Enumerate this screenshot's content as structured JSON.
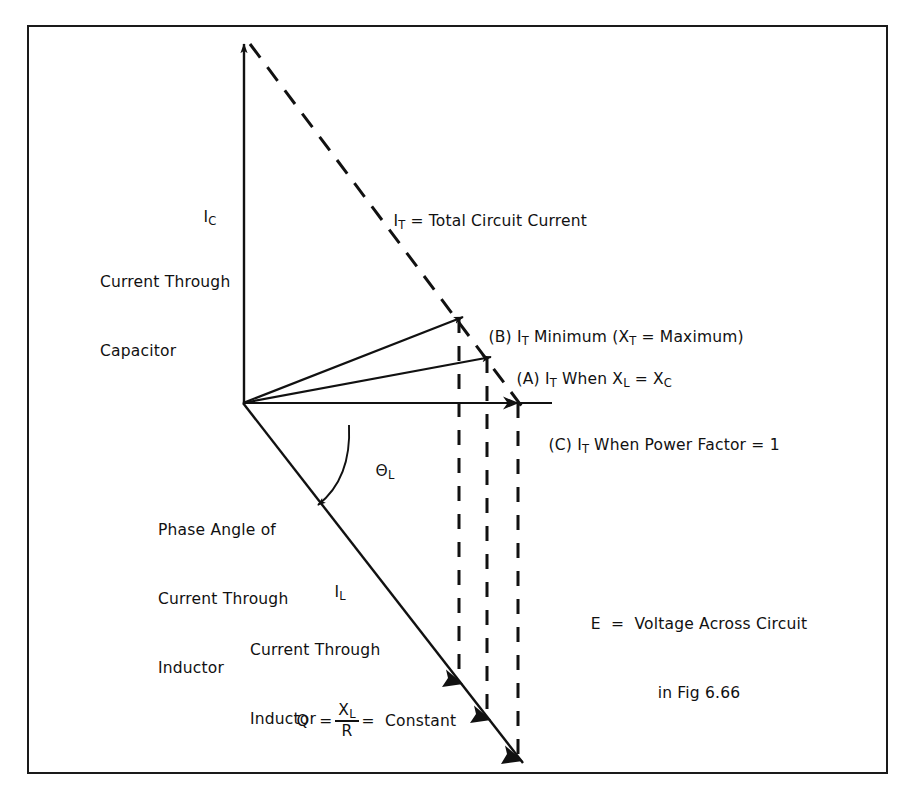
{
  "figure": {
    "kind": "phasor-diagram",
    "title_implicit": "Parallel LC circuit phasor diagram",
    "border_color": "#1a1a1a",
    "line_color": "#111111",
    "background": "#ffffff"
  },
  "axes": {
    "origin": {
      "x": 243,
      "y": 403
    },
    "vertical": {
      "name": "capacitive-current-axis",
      "tip": {
        "x": 244,
        "y": 37
      },
      "label_symbol": "I",
      "label_sub": "C",
      "caption_line1": "Current Through",
      "caption_line2": "Capacitor"
    },
    "horizontal": {
      "name": "resistive-axis",
      "end": {
        "x": 552,
        "y": 403
      }
    }
  },
  "vectors": [
    {
      "id": "IT-dashed",
      "name": "total-current-dashed-locus",
      "style": "dashed",
      "from": {
        "x": 249,
        "y": 42
      },
      "to": {
        "x": 522,
        "y": 406
      },
      "label": "I",
      "label_sub": "T",
      "label_text": " = Total Circuit Current"
    },
    {
      "id": "B",
      "name": "it-minimum-vector",
      "style": "solid-arrow",
      "from": {
        "x": 243,
        "y": 403
      },
      "to": {
        "x": 461,
        "y": 318
      },
      "marker": "(B)",
      "label_main": "I",
      "label_sub": "T",
      "label_rest": " Minimum (X",
      "label_sub2": "T",
      "label_rest2": " = Maximum)"
    },
    {
      "id": "A",
      "name": "it-resonance-vector",
      "style": "solid-arrow",
      "from": {
        "x": 243,
        "y": 403
      },
      "to": {
        "x": 489,
        "y": 358
      },
      "marker": "(A)",
      "label_main": "I",
      "label_sub": "T",
      "label_rest": " When X",
      "label_sub2": "L",
      "label_rest2": " = X",
      "label_sub3": "C"
    },
    {
      "id": "C",
      "name": "it-unity-power-factor-vector",
      "style": "solid-arrow",
      "from": {
        "x": 243,
        "y": 403
      },
      "to": {
        "x": 519,
        "y": 403
      },
      "marker": "(C)",
      "label_main": "I",
      "label_sub": "T",
      "label_rest": " When Power Factor = 1"
    },
    {
      "id": "IL",
      "name": "inductor-current-vector",
      "style": "solid-arrow-triple",
      "from": {
        "x": 243,
        "y": 403
      },
      "to": {
        "x": 522,
        "y": 762
      },
      "label_symbol": "I",
      "label_sub": "L",
      "caption_line1": "Current Through",
      "caption_line2": "Inductor",
      "arrowhead_points": [
        {
          "x": 461,
          "y": 682
        },
        {
          "x": 489,
          "y": 718
        },
        {
          "x": 520,
          "y": 758
        }
      ]
    }
  ],
  "projection_lines": [
    {
      "name": "projection-B",
      "x": 459,
      "y_top": 318,
      "y_bottom": 684
    },
    {
      "name": "projection-A",
      "x": 487,
      "y_top": 358,
      "y_bottom": 720
    },
    {
      "name": "projection-C",
      "x": 518,
      "y_top": 403,
      "y_bottom": 760
    }
  ],
  "angle": {
    "name": "phase-angle-arc",
    "symbol": "Θ",
    "sub": "L",
    "caption_line1": "Phase Angle of",
    "caption_line2": "Current Through",
    "caption_line3": "Inductor"
  },
  "notes": {
    "q_formula": {
      "name": "q-factor-formula",
      "lhs": "Q",
      "eq1": "=",
      "num": "X",
      "num_sub": "L",
      "den": "R",
      "eq2": "=",
      "rhs": "Constant"
    },
    "voltage_note": {
      "name": "voltage-reference-note",
      "line1": "E = Voltage Across Circuit",
      "line2": "in Fig 6.66"
    }
  },
  "labels": {
    "ic_symbol": "I",
    "ic_sub": "C",
    "ic_caption1": "Current Through",
    "ic_caption2": "Capacitor",
    "it_symbol": "I",
    "it_sub": "T",
    "it_caption": " = Total Circuit Current",
    "b_prefix": "(B) ",
    "b_mid": " Minimum (X",
    "b_end": " = Maximum)",
    "a_prefix": "(A) ",
    "a_mid": " When X",
    "a_mid2": " = X",
    "c_prefix": "(C) ",
    "c_mid": " When Power Factor = 1",
    "theta_symbol": "Θ",
    "theta_sub": "L",
    "phase_line1": "Phase Angle of",
    "phase_line2": "Current Through",
    "phase_line3": "Inductor",
    "il_symbol": "I",
    "il_sub": "L",
    "il_caption1": "Current Through",
    "il_caption2": "Inductor",
    "q_lhs": "Q  =",
    "q_num": "X",
    "q_num_sub": "L",
    "q_den": "R",
    "q_rhs": "=  Constant",
    "e_line1": "E  =  Voltage Across Circuit",
    "e_line2": "in Fig 6.66"
  }
}
